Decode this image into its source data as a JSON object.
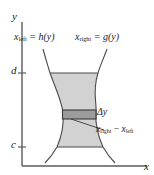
{
  "figure": {
    "type": "calculus-region-diagram",
    "axes": {
      "y_axis_label": "y",
      "x_axis_label": "x",
      "tick_upper_label": "d",
      "tick_lower_label": "c"
    },
    "curves": {
      "left_label_var": "x",
      "left_label_sub": "left",
      "left_label_eq": " = h(y)",
      "right_label_var": "x",
      "right_label_sub": "right",
      "right_label_eq": " = g(y)"
    },
    "strip": {
      "thickness_label": "Δy",
      "width_var_left": "x",
      "width_sub_left": "right",
      "width_minus": " − ",
      "width_var_right": "x",
      "width_sub_right": "left"
    },
    "colors": {
      "region_fill": "#d2d2d2",
      "strip_fill": "#9c9c9c",
      "curve_stroke": "#4a4a4a",
      "axis_stroke": "#5a5a5a",
      "text": "#1a1a1a",
      "background": "#ffffff"
    }
  }
}
